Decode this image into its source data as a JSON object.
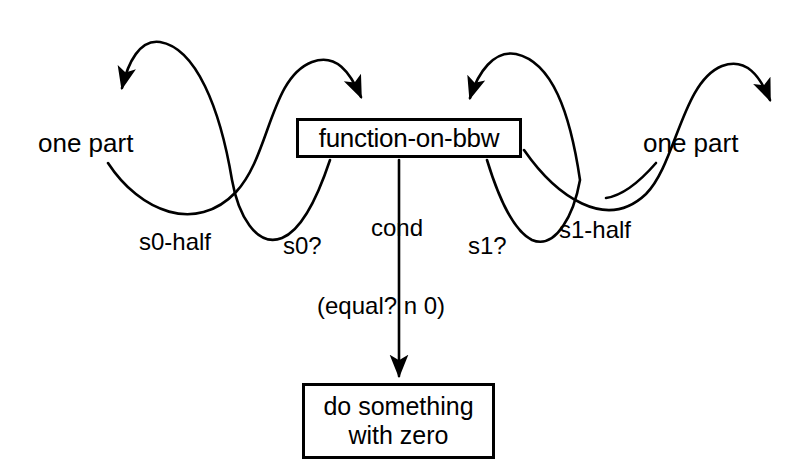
{
  "diagram": {
    "background_color": "#ffffff",
    "stroke_color": "#000000",
    "boxes": [
      {
        "id": "function-box",
        "label": "function-on-bbw"
      },
      {
        "id": "zero-box",
        "line1": "do something",
        "line2": "with zero"
      }
    ],
    "text_nodes": {
      "one_part_left": "one part",
      "one_part_right": "one part"
    },
    "edge_labels": {
      "s0_half": "s0-half",
      "s0_q": "s0?",
      "cond": "cond",
      "s1_q": "s1?",
      "s1_half": "s1-half",
      "equal_test": "(equal? n 0)"
    }
  }
}
